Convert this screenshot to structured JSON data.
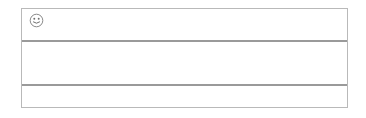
{
  "frame": {
    "label": "counting-rack",
    "border_color": "#b9b9b9",
    "background_color": "#ffffff"
  },
  "badge": {
    "icon": "smiley-face-icon",
    "alt_text": "smiley"
  },
  "colors": {
    "bead_light": "#c9c9c9",
    "bead_dark": "#8f8f8f",
    "bead_outline": "#8c8c8c",
    "wire": "#9a9a9a",
    "frame_border": "#b9b9b9"
  },
  "rows": [
    {
      "row_label": "row-1",
      "total_beads": 10,
      "groups": [
        {
          "group_label": "row-1-left-group",
          "alignment": "left",
          "count": 6,
          "beads": [
            "light",
            "light",
            "light",
            "light",
            "light",
            "dark"
          ]
        },
        {
          "group_label": "row-1-right-group",
          "alignment": "right",
          "count": 4,
          "beads": [
            "dark",
            "dark",
            "dark",
            "dark"
          ]
        }
      ]
    },
    {
      "row_label": "row-2",
      "total_beads": 10,
      "groups": [
        {
          "group_label": "row-2-right-group",
          "alignment": "right",
          "count": 10,
          "beads": [
            "light",
            "light",
            "light",
            "light",
            "light",
            "dark",
            "dark",
            "dark",
            "dark",
            "dark"
          ]
        }
      ]
    }
  ]
}
